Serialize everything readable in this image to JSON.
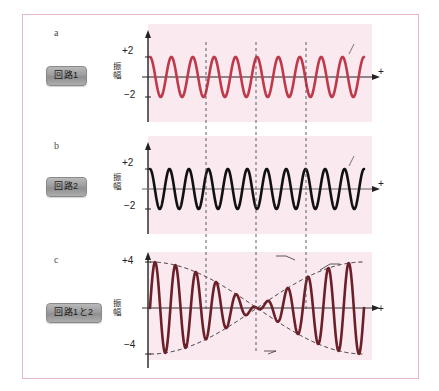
{
  "figure": {
    "background": "#ffffff",
    "frame_color": "#e8b9c2",
    "plot_band_color": "#fae9ee"
  },
  "panels": [
    {
      "id": "a",
      "letter": "a",
      "circuit_label": "回路1",
      "axis_label": "振\n幅",
      "axis_label_chars": [
        "振",
        "幅"
      ],
      "y_top_tick": "+2",
      "y_bottom_tick": "−2",
      "x_axis_plus": "+",
      "frequency_label": "5,000 Hz",
      "wave_color": "#c0394b"
    },
    {
      "id": "b",
      "letter": "b",
      "circuit_label": "回路2",
      "axis_label_chars": [
        "振",
        "幅"
      ],
      "y_top_tick": "+2",
      "y_bottom_tick": "−2",
      "x_axis_plus": "+",
      "frequency_label": "5,100 Hz",
      "wave_color": "#111111"
    },
    {
      "id": "c",
      "letter": "c",
      "circuit_label": "回路1と2",
      "axis_label_chars": [
        "振",
        "幅"
      ],
      "y_top_tick": "+4",
      "y_bottom_tick": "−4",
      "x_axis_plus": "+",
      "wave_color": "#6b1f28",
      "envelope_color": "#1a1a1a",
      "annotations": {
        "max": "最大",
        "beat": "うなり",
        "beat_frequency": "100 Hz",
        "zero": "0"
      }
    }
  ],
  "chart_data": [
    {
      "type": "line",
      "id": "a",
      "title": "5,000 Hz",
      "xlabel": "+",
      "ylabel": "振幅",
      "ylim": [
        -2,
        2
      ],
      "yticks": [
        2,
        -2
      ],
      "ytick_labels": [
        "+2",
        "−2"
      ],
      "series": [
        {
          "name": "5,000 Hz",
          "amplitude": 2,
          "cycles": 10,
          "color": "#c0394b"
        }
      ],
      "grid": false,
      "legend": "none"
    },
    {
      "type": "line",
      "id": "b",
      "title": "5,100 Hz",
      "xlabel": "+",
      "ylabel": "振幅",
      "ylim": [
        -2,
        2
      ],
      "yticks": [
        2,
        -2
      ],
      "ytick_labels": [
        "+2",
        "−2"
      ],
      "series": [
        {
          "name": "5,100 Hz",
          "amplitude": 2,
          "cycles": 11,
          "color": "#111111"
        }
      ],
      "grid": false,
      "legend": "none"
    },
    {
      "type": "line",
      "id": "c",
      "title": "回路1と2 合成波",
      "xlabel": "+",
      "ylabel": "振幅",
      "ylim": [
        -4,
        4
      ],
      "yticks": [
        4,
        -4
      ],
      "ytick_labels": [
        "+4",
        "−4"
      ],
      "series": [
        {
          "name": "sum",
          "amplitude": 4,
          "cycles": 10.5,
          "color": "#6b1f28"
        },
        {
          "name": "envelope (うなり 100 Hz)",
          "amplitude": 4,
          "cycles": 1,
          "color": "#1a1a1a",
          "style": "dashed"
        }
      ],
      "annotations": [
        "最大",
        "うなり",
        "100 Hz",
        "0"
      ],
      "grid": false,
      "legend": "none"
    }
  ]
}
